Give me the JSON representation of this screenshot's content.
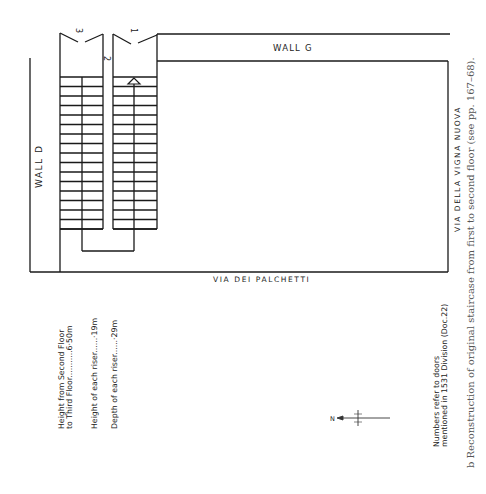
{
  "diagram": {
    "labels": {
      "wall_d": "WALL D",
      "wall_g": "WALL G",
      "via_palchetti": "VIA DEI PALCHETTI",
      "via_vigna": "VIA DELLA VIGNA NUOVA",
      "door_1": "1",
      "door_2": "2",
      "door_3": "3",
      "north": "N"
    },
    "notes": {
      "height_floor_1": "Height from Second Floor",
      "height_floor_2": "to Third Floor...........6·50m",
      "riser_height": "Height of each riser......·19m",
      "riser_depth": "Depth of each riser......·29m",
      "numbers_1": "Numbers refer to doors",
      "numbers_2": "mentioned in 1531 Division (Doc.22)"
    },
    "caption": "b   Reconstruction of original staircase from first to second floor (see pp. 167–68).",
    "steps_per_flight": 17
  }
}
